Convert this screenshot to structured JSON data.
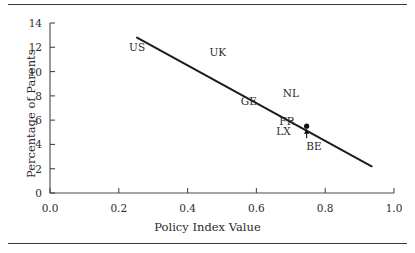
{
  "figure": {
    "has_top_rule": true,
    "has_bottom_rule": true,
    "rule_color": "#3a3a3a"
  },
  "chart_data": {
    "type": "scatter",
    "title": "",
    "subtitle": "",
    "xlabel": "Policy Index Value",
    "ylabel": "Percentage of Parents",
    "xlim": [
      0.0,
      1.0
    ],
    "ylim": [
      0,
      14
    ],
    "xticks": [
      "0.0",
      "0.2",
      "0.4",
      "0.6",
      "0.8",
      "1.0"
    ],
    "xtick_values": [
      0.0,
      0.2,
      0.4,
      0.6,
      0.8,
      1.0
    ],
    "yticks": [
      "0",
      "2",
      "4",
      "6",
      "8",
      "10",
      "12",
      "14"
    ],
    "ytick_values": [
      0,
      2,
      4,
      6,
      8,
      10,
      12,
      14
    ],
    "grid": false,
    "legend": false,
    "legend_position": "none",
    "line_color": "#1c1c1c",
    "fit_line": {
      "label": "regression line",
      "x_start": 0.253,
      "y_start": 12.8,
      "x_end": 0.935,
      "y_end": 2.2
    },
    "labels": [
      {
        "name": "US",
        "x": 0.253,
        "y": 12.0
      },
      {
        "name": "UK",
        "x": 0.487,
        "y": 11.6
      },
      {
        "name": "GE",
        "x": 0.578,
        "y": 7.6
      },
      {
        "name": "NL",
        "x": 0.7,
        "y": 8.2
      },
      {
        "name": "FR",
        "x": 0.69,
        "y": 5.9
      },
      {
        "name": "LX",
        "x": 0.681,
        "y": 5.1
      },
      {
        "name": "BE",
        "x": 0.768,
        "y": 3.9
      }
    ],
    "markers": [
      {
        "name": "BE",
        "x": 0.746,
        "y": 5.5
      }
    ],
    "annotations": [
      {
        "type": "arrow",
        "label": "BE",
        "from_x": 0.746,
        "from_y": 4.5,
        "to_x": 0.746,
        "to_y": 5.3,
        "direction": "up"
      }
    ]
  }
}
